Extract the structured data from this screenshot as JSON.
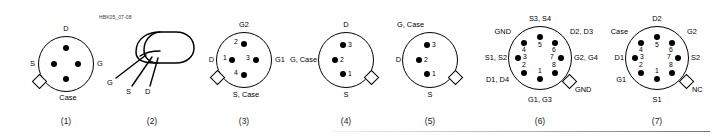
{
  "sheet": {
    "handbook_code": "HBK05_07-08"
  },
  "figures": [
    {
      "caption": "(1)",
      "pin_count": 4,
      "numbered": false,
      "tab_position": "lower-left",
      "tab_label": "Case",
      "labels": {
        "top": "D",
        "left": "S",
        "right": "G",
        "bottom": "Case"
      }
    },
    {
      "caption": "(2)",
      "type": "perspective-can",
      "leads": [
        "G",
        "S",
        "D"
      ]
    },
    {
      "caption": "(3)",
      "pin_count": 4,
      "numbered": true,
      "tab_position": "lower-left",
      "labels": {
        "top": "G2",
        "left": "D",
        "right": "G1",
        "bottom": "S, Case"
      },
      "pins": [
        {
          "number": "1",
          "terminal": "D"
        },
        {
          "number": "2",
          "terminal": "G2"
        },
        {
          "number": "3",
          "terminal": "G1"
        },
        {
          "number": "4",
          "terminal": "S, Case"
        }
      ]
    },
    {
      "caption": "(4)",
      "pin_count": 3,
      "numbered": true,
      "tab_position": "lower-right",
      "labels": {
        "top": "D",
        "left": "G, Case",
        "bottom": "S"
      },
      "pins": [
        {
          "number": "1",
          "terminal": "S"
        },
        {
          "number": "2",
          "terminal": "G, Case"
        },
        {
          "number": "3",
          "terminal": "D"
        }
      ]
    },
    {
      "caption": "(5)",
      "pin_count": 3,
      "numbered": true,
      "tab_position": "lower-right",
      "labels": {
        "top_left": "G, Case",
        "left": "D",
        "bottom": "S"
      },
      "pins": [
        {
          "number": "1",
          "terminal": "S"
        },
        {
          "number": "2",
          "terminal": "D"
        },
        {
          "number": "3",
          "terminal": "G, Case"
        }
      ]
    },
    {
      "caption": "(6)",
      "pin_count": 8,
      "numbered": true,
      "tab_position": "lower-right",
      "tab_label": "GND",
      "labels": {
        "top": "S3, S4",
        "top_left": "GND",
        "top_right": "D2, D3",
        "left": "S1, S2",
        "right": "G2, G4",
        "bottom_left": "D1, D4",
        "bottom": "G1, G3"
      },
      "pins": [
        {
          "number": "1",
          "terminal": "G1, G3"
        },
        {
          "number": "2",
          "terminal": "D1, D4"
        },
        {
          "number": "3",
          "terminal": "S1, S2"
        },
        {
          "number": "4",
          "terminal": "GND"
        },
        {
          "number": "5",
          "terminal": "S3, S4"
        },
        {
          "number": "6",
          "terminal": "D2, D3"
        },
        {
          "number": "7",
          "terminal": "G2, G4"
        },
        {
          "number": "8",
          "terminal": "GND"
        }
      ]
    },
    {
      "caption": "(7)",
      "pin_count": 8,
      "numbered": true,
      "tab_position": "lower-right",
      "tab_label": "NC",
      "labels": {
        "top": "D2",
        "top_left": "Case",
        "top_right": "G2",
        "left": "D1",
        "right": "S2",
        "bottom_left": "G1",
        "bottom": "S1"
      },
      "pins": [
        {
          "number": "1",
          "terminal": "S1"
        },
        {
          "number": "2",
          "terminal": "G1"
        },
        {
          "number": "3",
          "terminal": "D1"
        },
        {
          "number": "4",
          "terminal": "Case"
        },
        {
          "number": "5",
          "terminal": "D2"
        },
        {
          "number": "6",
          "terminal": "G2"
        },
        {
          "number": "7",
          "terminal": "S2"
        },
        {
          "number": "8",
          "terminal": "NC"
        }
      ]
    }
  ]
}
